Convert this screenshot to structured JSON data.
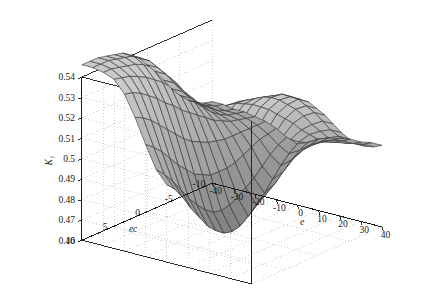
{
  "figure": {
    "kind": "3d-surface-plot",
    "background": "#ffffff",
    "mesh_line_color": "#3a3a3a",
    "axis_line_color": "#1a1a1a",
    "grid_line_color": "#b9b9b9",
    "surface_light": "#c9c9c9",
    "surface_mid": "#a8a8a8",
    "surface_dark": "#7e7e7e",
    "title": ""
  },
  "chart_data": {
    "type": "surface",
    "title": "",
    "xlabel": "e",
    "ylabel": "ec",
    "zlabel": "K₁",
    "xlim": [
      -40,
      40
    ],
    "ylim": [
      -10,
      10
    ],
    "zlim": [
      0.46,
      0.54
    ],
    "grid": true,
    "legend": "none",
    "x_ticks": [
      -40,
      -30,
      -20,
      -10,
      0,
      10,
      20,
      30,
      40
    ],
    "x_tick_labels": [
      "-40",
      "-30",
      "-20",
      "-10",
      "0",
      "10",
      "20",
      "30",
      "40"
    ],
    "y_ticks": [
      10,
      5,
      0,
      -5,
      -10
    ],
    "y_tick_labels": [
      "10",
      "5",
      "0",
      "-5",
      "-10"
    ],
    "z_ticks": [
      0.46,
      0.47,
      0.48,
      0.49,
      0.5,
      0.51,
      0.52,
      0.53,
      0.54
    ],
    "z_tick_labels": [
      "0.46",
      "0.47",
      "0.48",
      "0.49",
      "0.5",
      "0.51",
      "0.52",
      "0.53",
      "0.54"
    ],
    "view": {
      "azimuth": -37.5,
      "elevation": 22
    },
    "x": [
      -40,
      -35,
      -30,
      -25,
      -20,
      -15,
      -10,
      -5,
      0,
      5,
      10,
      15,
      20,
      25,
      30,
      35,
      40
    ],
    "y": [
      -10,
      -8.75,
      -7.5,
      -6.25,
      -5,
      -3.75,
      -2.5,
      -1.25,
      0,
      1.25,
      2.5,
      3.75,
      5,
      6.25,
      7.5,
      8.75,
      10
    ],
    "z_description": "Sigmoid saddle surface: K1 rises from about 0.46 in the near-front valley (e near -10..+10 with ec near -10) to about 0.545 on the far back plateau (large |e| with ec near +10); flat wings at about 0.49-0.50 on the left and right sides.",
    "z": [
      [
        0.5,
        0.5,
        0.499,
        0.499,
        0.498,
        0.497,
        0.495,
        0.492,
        0.49,
        0.492,
        0.495,
        0.497,
        0.498,
        0.499,
        0.499,
        0.5,
        0.5
      ],
      [
        0.501,
        0.501,
        0.5,
        0.5,
        0.499,
        0.497,
        0.494,
        0.49,
        0.487,
        0.49,
        0.494,
        0.497,
        0.499,
        0.5,
        0.5,
        0.501,
        0.501
      ],
      [
        0.503,
        0.503,
        0.502,
        0.501,
        0.5,
        0.497,
        0.493,
        0.487,
        0.483,
        0.487,
        0.493,
        0.497,
        0.5,
        0.501,
        0.502,
        0.503,
        0.503
      ],
      [
        0.506,
        0.506,
        0.505,
        0.503,
        0.501,
        0.497,
        0.491,
        0.483,
        0.478,
        0.483,
        0.491,
        0.497,
        0.501,
        0.503,
        0.505,
        0.506,
        0.506
      ],
      [
        0.51,
        0.51,
        0.508,
        0.506,
        0.503,
        0.497,
        0.489,
        0.479,
        0.473,
        0.479,
        0.489,
        0.497,
        0.503,
        0.506,
        0.508,
        0.51,
        0.51
      ],
      [
        0.515,
        0.515,
        0.513,
        0.51,
        0.505,
        0.497,
        0.487,
        0.476,
        0.469,
        0.476,
        0.487,
        0.497,
        0.505,
        0.51,
        0.513,
        0.515,
        0.515
      ],
      [
        0.521,
        0.521,
        0.518,
        0.514,
        0.508,
        0.498,
        0.486,
        0.473,
        0.465,
        0.473,
        0.486,
        0.498,
        0.508,
        0.514,
        0.518,
        0.521,
        0.521
      ],
      [
        0.527,
        0.527,
        0.524,
        0.519,
        0.511,
        0.499,
        0.486,
        0.471,
        0.462,
        0.471,
        0.486,
        0.499,
        0.511,
        0.519,
        0.524,
        0.527,
        0.527
      ],
      [
        0.532,
        0.532,
        0.529,
        0.523,
        0.514,
        0.501,
        0.486,
        0.47,
        0.461,
        0.47,
        0.486,
        0.501,
        0.514,
        0.523,
        0.529,
        0.532,
        0.532
      ],
      [
        0.537,
        0.537,
        0.533,
        0.527,
        0.517,
        0.503,
        0.488,
        0.471,
        0.462,
        0.471,
        0.488,
        0.503,
        0.517,
        0.527,
        0.533,
        0.537,
        0.537
      ],
      [
        0.54,
        0.54,
        0.537,
        0.531,
        0.521,
        0.506,
        0.49,
        0.474,
        0.465,
        0.474,
        0.49,
        0.506,
        0.521,
        0.531,
        0.537,
        0.54,
        0.54
      ],
      [
        0.543,
        0.543,
        0.54,
        0.534,
        0.524,
        0.51,
        0.494,
        0.478,
        0.469,
        0.478,
        0.494,
        0.51,
        0.524,
        0.534,
        0.54,
        0.543,
        0.543
      ],
      [
        0.544,
        0.544,
        0.542,
        0.537,
        0.528,
        0.514,
        0.498,
        0.483,
        0.475,
        0.483,
        0.498,
        0.514,
        0.528,
        0.537,
        0.542,
        0.544,
        0.544
      ],
      [
        0.545,
        0.545,
        0.543,
        0.539,
        0.531,
        0.518,
        0.503,
        0.489,
        0.481,
        0.489,
        0.503,
        0.518,
        0.531,
        0.539,
        0.543,
        0.545,
        0.545
      ],
      [
        0.546,
        0.546,
        0.544,
        0.541,
        0.534,
        0.522,
        0.508,
        0.495,
        0.488,
        0.495,
        0.508,
        0.522,
        0.534,
        0.541,
        0.544,
        0.546,
        0.546
      ],
      [
        0.546,
        0.546,
        0.545,
        0.542,
        0.536,
        0.525,
        0.512,
        0.5,
        0.494,
        0.5,
        0.512,
        0.525,
        0.536,
        0.542,
        0.545,
        0.546,
        0.546
      ],
      [
        0.546,
        0.546,
        0.545,
        0.543,
        0.537,
        0.527,
        0.515,
        0.504,
        0.498,
        0.504,
        0.515,
        0.527,
        0.537,
        0.543,
        0.545,
        0.546,
        0.546
      ]
    ]
  }
}
